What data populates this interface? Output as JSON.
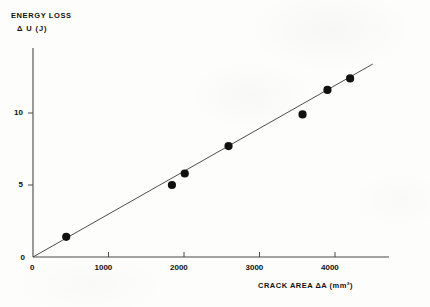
{
  "chart_data": {
    "type": "scatter",
    "title": "",
    "xlabel": "CRACK  AREA   ΔA  (mm²)",
    "ylabel_line1": "ENERGY LOSS",
    "ylabel_line2": "Δ U  (J)",
    "x_unit": "mm2",
    "y_unit": "J",
    "xlim": [
      0,
      4700
    ],
    "ylim": [
      0,
      14.5
    ],
    "xticks": [
      0,
      1000,
      2000,
      3000,
      4000
    ],
    "xtick_labels": [
      "0",
      "1000",
      "2000",
      "3000",
      "4000"
    ],
    "yticks": [
      0,
      5,
      10
    ],
    "ytick_labels": [
      "0",
      "5",
      "10"
    ],
    "origin_label": "0",
    "grid": false,
    "legend": null,
    "marker": "filled-circle",
    "marker_color": "#111111",
    "line_color": "#3a3a3a",
    "points": [
      {
        "x": 440,
        "y": 1.4
      },
      {
        "x": 1840,
        "y": 5.0
      },
      {
        "x": 2010,
        "y": 5.8
      },
      {
        "x": 2590,
        "y": 7.7
      },
      {
        "x": 3570,
        "y": 9.9
      },
      {
        "x": 3900,
        "y": 11.6
      },
      {
        "x": 4200,
        "y": 12.4
      }
    ],
    "fit_line": {
      "description": "best-fit straight line through origin",
      "x_start": 0,
      "y_start": 0,
      "x_end": 4500,
      "y_end": 13.4
    }
  }
}
